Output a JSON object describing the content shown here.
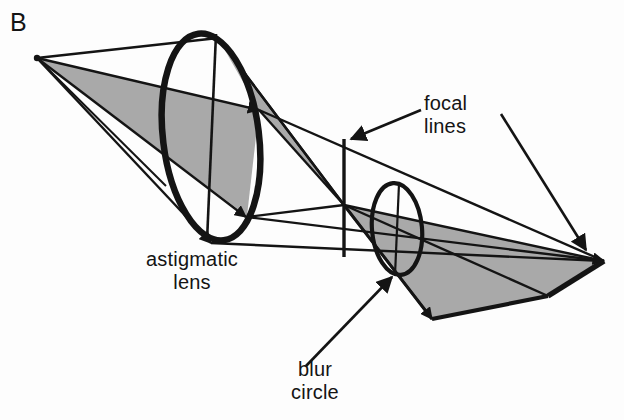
{
  "figure": {
    "domain": "Diagram",
    "panel_letter": "B",
    "width": 624,
    "height": 420,
    "background_color": "#fdfdfd",
    "ink_color": "#141414",
    "shade_color": "#a9a9a9"
  },
  "labels": {
    "panel": "B",
    "astigmatic_lens": {
      "line1": "astigmatic",
      "line2": "lens"
    },
    "focal_lines": {
      "line1": "focal",
      "line2": "lines"
    },
    "blur_circle": {
      "line1": "blur",
      "line2": "circle"
    }
  },
  "optics": {
    "source_point": {
      "name": "B",
      "x": 37,
      "y": 58
    },
    "lens": {
      "name": "astigmatic-lens",
      "center_x": 211,
      "center_y": 137,
      "radius_x": 48,
      "radius_y": 104,
      "rotation_deg": -7,
      "stroke_width": 6
    },
    "blur_circle": {
      "name": "blur-circle",
      "center_x": 397,
      "center_y": 229,
      "radius_x": 25,
      "radius_y": 46,
      "rotation_deg": -5,
      "stroke_width": 4
    },
    "focal_line_1": {
      "orientation": "vertical",
      "x1": 344,
      "y1": 139,
      "x2": 344,
      "y2": 257
    },
    "focal_line_2": {
      "orientation": "diagonal",
      "x1": 548,
      "y1": 296,
      "x2": 604,
      "y2": 261
    },
    "crossover_point": {
      "x": 344,
      "y": 205
    },
    "right_apex": {
      "x": 604,
      "y": 261
    },
    "lower_apex": {
      "x": 548,
      "y": 296
    }
  },
  "annotations": [
    {
      "name": "focal-lines-callout-left",
      "text": "focal lines",
      "arrow_from": {
        "x": 421,
        "y": 110
      },
      "arrow_to": {
        "x": 350,
        "y": 139
      }
    },
    {
      "name": "focal-lines-callout-right",
      "text": "focal lines",
      "arrow_from": {
        "x": 501,
        "y": 114
      },
      "arrow_to": {
        "x": 586,
        "y": 250
      }
    },
    {
      "name": "blur-circle-callout",
      "text": "blur circle",
      "arrow_from": {
        "x": 306,
        "y": 366
      },
      "arrow_to": {
        "x": 392,
        "y": 277
      }
    }
  ]
}
